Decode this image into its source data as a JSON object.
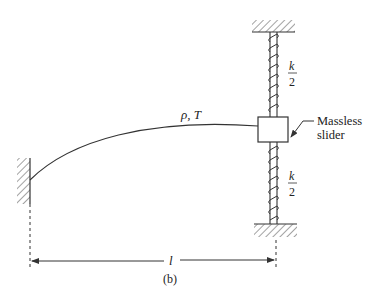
{
  "figure": {
    "label": "(b)",
    "string_label": "ρ, T",
    "string_label_rho": "ρ",
    "string_label_T": "T",
    "spring_top": {
      "numerator": "k",
      "denominator": "2"
    },
    "spring_bottom": {
      "numerator": "k",
      "denominator": "2"
    },
    "slider_label_line1": "Massless",
    "slider_label_line2": "slider",
    "dimension_label": "l"
  },
  "colors": {
    "ink": "#333333",
    "background": "#ffffff"
  }
}
